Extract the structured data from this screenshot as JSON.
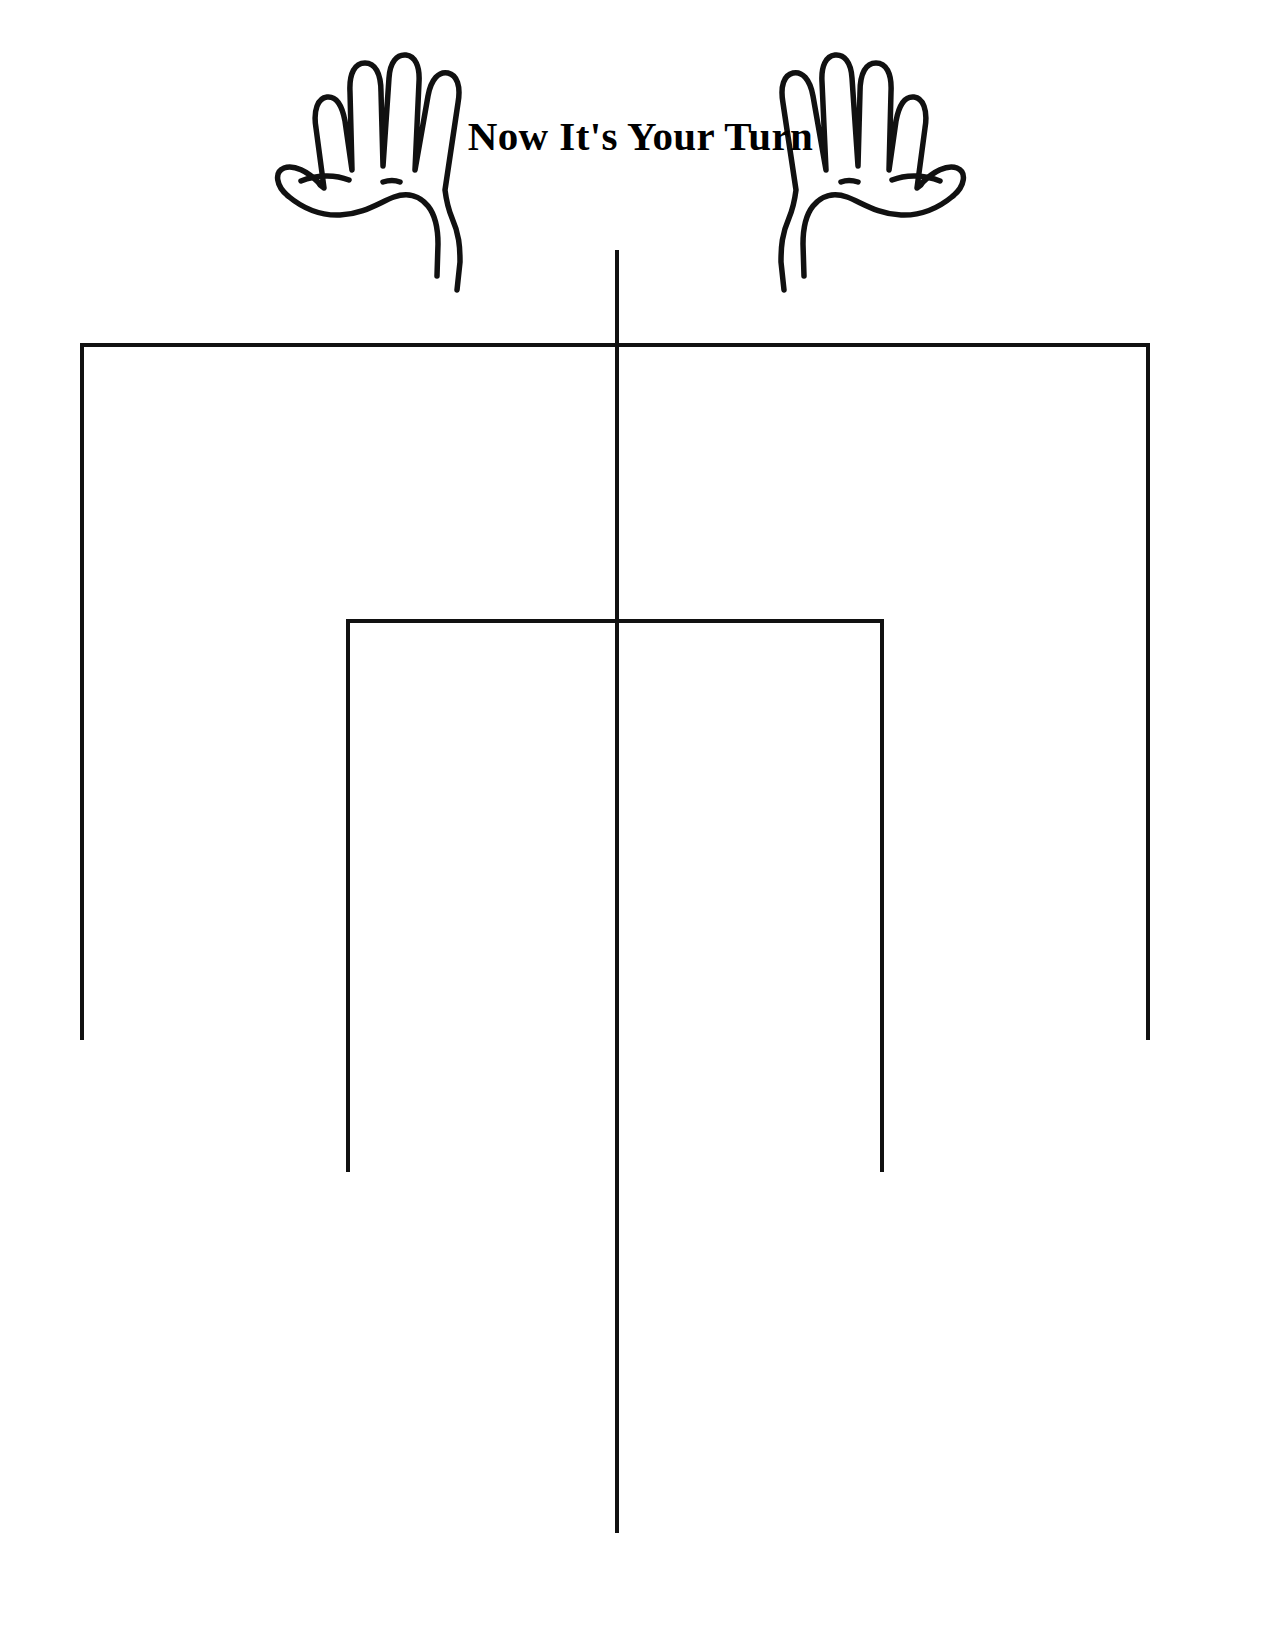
{
  "page": {
    "background_color": "#ffffff",
    "ink_color": "#111111",
    "width": 1281,
    "height": 1628
  },
  "header": {
    "title": "Now It's Your Turn",
    "left_icon": "open-hand-left-icon",
    "right_icon": "open-hand-right-icon"
  },
  "diagram": {
    "type": "blank-hierarchy-organizer",
    "outer_bracket": {
      "name": "outer-bracket",
      "top_y": 345,
      "left_x": 82,
      "right_x": 1150,
      "leg_bottom_y": 1040
    },
    "inner_bracket": {
      "name": "inner-bracket",
      "top_y": 621,
      "left_x": 348,
      "right_x": 882,
      "leg_bottom_y": 1172
    },
    "center_stem": {
      "name": "center-stem",
      "x": 617,
      "top_y": 250,
      "bottom_y": 1533
    },
    "stroke_width": 4
  }
}
